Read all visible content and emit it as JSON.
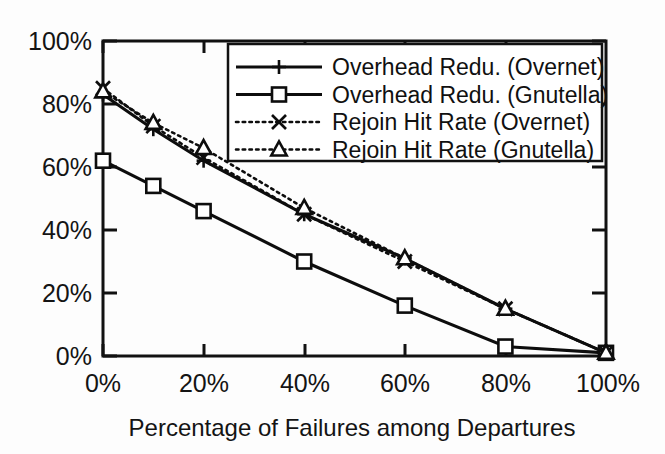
{
  "figure": {
    "background": "#fdfdfd",
    "ink_color": "#111111"
  },
  "axis": {
    "x_title": "Percentage of Failures among Departures",
    "y_title": "",
    "x_ticks": [
      "0%",
      "20%",
      "40%",
      "60%",
      "80%",
      "100%"
    ],
    "y_ticks": [
      "0%",
      "20%",
      "40%",
      "60%",
      "80%",
      "100%"
    ]
  },
  "legend": {
    "entries": [
      {
        "label": "Overhead Redu. (Overnet)",
        "style": "solid",
        "marker": "plus"
      },
      {
        "label": "Overhead Redu. (Gnutella)",
        "style": "solid",
        "marker": "square"
      },
      {
        "label": "Rejoin Hit Rate (Overnet)",
        "style": "dotted",
        "marker": "x"
      },
      {
        "label": "Rejoin Hit Rate (Gnutella)",
        "style": "dotted",
        "marker": "triangle"
      }
    ]
  },
  "chart_data": {
    "type": "line",
    "title": "",
    "xlabel": "Percentage of Failures among Departures",
    "ylabel": "",
    "xlim": [
      0,
      100
    ],
    "ylim": [
      0,
      100
    ],
    "xticks": [
      0,
      20,
      40,
      60,
      80,
      100
    ],
    "yticks": [
      0,
      20,
      40,
      60,
      80,
      100
    ],
    "xtick_labels": [
      "0%",
      "20%",
      "40%",
      "60%",
      "80%",
      "100%"
    ],
    "ytick_labels": [
      "0%",
      "20%",
      "40%",
      "60%",
      "80%",
      "100%"
    ],
    "grid": false,
    "legend_position": "top-right",
    "x": [
      0,
      10,
      20,
      40,
      60,
      80,
      100
    ],
    "series": [
      {
        "name": "Overhead Redu. (Overnet)",
        "style": "solid",
        "marker": "plus",
        "values": [
          83,
          72,
          62,
          45,
          31,
          15,
          1
        ]
      },
      {
        "name": "Overhead Redu. (Gnutella)",
        "style": "solid",
        "marker": "square",
        "values": [
          62,
          54,
          46,
          30,
          16,
          3,
          1
        ]
      },
      {
        "name": "Rejoin Hit Rate (Overnet)",
        "style": "dotted",
        "marker": "x",
        "values": [
          85,
          73,
          63,
          45,
          30,
          15,
          1
        ]
      },
      {
        "name": "Rejoin Hit Rate (Gnutella)",
        "style": "dotted",
        "marker": "triangle",
        "values": [
          84,
          74,
          66,
          47,
          31,
          15,
          1
        ]
      }
    ]
  }
}
